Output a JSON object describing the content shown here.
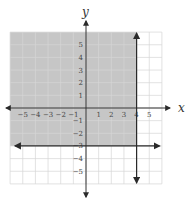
{
  "chart_data": {
    "type": "inequality-graph",
    "title": "",
    "xlabel": "x",
    "ylabel": "y",
    "xlim": [
      -6,
      6
    ],
    "ylim": [
      -6,
      6
    ],
    "grid": true,
    "x_ticks": [
      "-5",
      "-4",
      "-3",
      "-2",
      "-1",
      "1",
      "2",
      "3",
      "4",
      "5"
    ],
    "y_ticks": [
      "5",
      "4",
      "3",
      "2",
      "1",
      "-1",
      "-2",
      "-3",
      "-4",
      "-5"
    ],
    "lines": [
      {
        "name": "boundary-vertical",
        "equation": "x = 4",
        "style": "solid",
        "arrows": "both"
      },
      {
        "name": "boundary-horizontal",
        "equation": "y = -3",
        "style": "solid",
        "arrows": "both"
      }
    ],
    "shaded_region": {
      "description": "x <= 4 and y >= -3",
      "x_range": [
        -6,
        4
      ],
      "y_range": [
        -3,
        6
      ],
      "color": "#c8c8c8"
    }
  },
  "colors": {
    "grid": "#d6d6d6",
    "axis": "#333333",
    "shade": "#c6c6c6",
    "line": "#2a2a2a"
  }
}
